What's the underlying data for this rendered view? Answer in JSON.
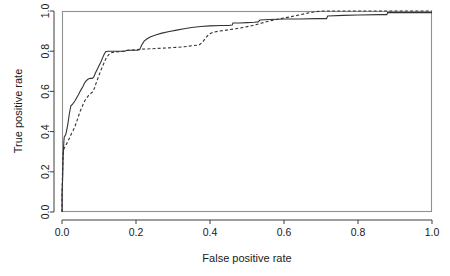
{
  "chart_data": {
    "type": "line",
    "title": "",
    "xlabel": "False positive rate",
    "ylabel": "True positive rate",
    "xlim": [
      0.0,
      1.0
    ],
    "ylim": [
      0.0,
      1.0
    ],
    "grid": false,
    "legend": "none",
    "xticks": [
      "0.0",
      "0.2",
      "0.4",
      "0.6",
      "0.8",
      "1.0"
    ],
    "xtick_values": [
      0.0,
      0.2,
      0.4,
      0.6,
      0.8,
      1.0
    ],
    "yticks": [
      "0.0",
      "0.2",
      "0.4",
      "0.6",
      "0.8",
      "1.0"
    ],
    "ytick_values": [
      0.0,
      0.2,
      0.4,
      0.6,
      0.8,
      1.0
    ],
    "series": [
      {
        "name": "solid-roc-curve",
        "style": "solid",
        "color": "#333333",
        "points": [
          [
            0.0,
            0.0
          ],
          [
            0.0,
            0.09
          ],
          [
            0.002,
            0.18
          ],
          [
            0.003,
            0.265
          ],
          [
            0.004,
            0.31
          ],
          [
            0.005,
            0.35
          ],
          [
            0.006,
            0.372
          ],
          [
            0.01,
            0.385
          ],
          [
            0.012,
            0.4
          ],
          [
            0.014,
            0.42
          ],
          [
            0.016,
            0.44
          ],
          [
            0.018,
            0.465
          ],
          [
            0.02,
            0.49
          ],
          [
            0.022,
            0.51
          ],
          [
            0.024,
            0.528
          ],
          [
            0.028,
            0.535
          ],
          [
            0.032,
            0.545
          ],
          [
            0.036,
            0.556
          ],
          [
            0.04,
            0.57
          ],
          [
            0.044,
            0.582
          ],
          [
            0.048,
            0.597
          ],
          [
            0.052,
            0.61
          ],
          [
            0.056,
            0.622
          ],
          [
            0.06,
            0.638
          ],
          [
            0.064,
            0.65
          ],
          [
            0.07,
            0.66
          ],
          [
            0.076,
            0.665
          ],
          [
            0.082,
            0.665
          ],
          [
            0.086,
            0.672
          ],
          [
            0.09,
            0.69
          ],
          [
            0.094,
            0.705
          ],
          [
            0.098,
            0.72
          ],
          [
            0.102,
            0.735
          ],
          [
            0.106,
            0.75
          ],
          [
            0.11,
            0.768
          ],
          [
            0.114,
            0.785
          ],
          [
            0.118,
            0.797
          ],
          [
            0.124,
            0.8
          ],
          [
            0.15,
            0.8
          ],
          [
            0.17,
            0.8
          ],
          [
            0.175,
            0.805
          ],
          [
            0.195,
            0.805
          ],
          [
            0.205,
            0.805
          ],
          [
            0.21,
            0.808
          ],
          [
            0.215,
            0.83
          ],
          [
            0.222,
            0.85
          ],
          [
            0.23,
            0.862
          ],
          [
            0.24,
            0.872
          ],
          [
            0.255,
            0.882
          ],
          [
            0.27,
            0.89
          ],
          [
            0.29,
            0.898
          ],
          [
            0.31,
            0.905
          ],
          [
            0.33,
            0.912
          ],
          [
            0.35,
            0.918
          ],
          [
            0.375,
            0.923
          ],
          [
            0.4,
            0.926
          ],
          [
            0.43,
            0.928
          ],
          [
            0.45,
            0.928
          ],
          [
            0.46,
            0.93
          ],
          [
            0.462,
            0.94
          ],
          [
            0.48,
            0.94
          ],
          [
            0.5,
            0.942
          ],
          [
            0.52,
            0.944
          ],
          [
            0.53,
            0.946
          ],
          [
            0.535,
            0.955
          ],
          [
            0.56,
            0.958
          ],
          [
            0.6,
            0.96
          ],
          [
            0.64,
            0.96
          ],
          [
            0.69,
            0.962
          ],
          [
            0.715,
            0.962
          ],
          [
            0.718,
            0.975
          ],
          [
            0.76,
            0.978
          ],
          [
            0.8,
            0.98
          ],
          [
            0.86,
            0.982
          ],
          [
            0.878,
            0.982
          ],
          [
            0.88,
            0.992
          ],
          [
            0.94,
            0.992
          ],
          [
            1.0,
            0.992
          ]
        ]
      },
      {
        "name": "dashed-roc-curve",
        "style": "dashed",
        "color": "#333333",
        "points": [
          [
            0.0,
            0.0
          ],
          [
            0.0,
            0.08
          ],
          [
            0.001,
            0.16
          ],
          [
            0.002,
            0.24
          ],
          [
            0.003,
            0.29
          ],
          [
            0.004,
            0.305
          ],
          [
            0.006,
            0.318
          ],
          [
            0.01,
            0.33
          ],
          [
            0.014,
            0.345
          ],
          [
            0.018,
            0.36
          ],
          [
            0.022,
            0.375
          ],
          [
            0.026,
            0.392
          ],
          [
            0.03,
            0.405
          ],
          [
            0.034,
            0.42
          ],
          [
            0.038,
            0.44
          ],
          [
            0.042,
            0.462
          ],
          [
            0.046,
            0.485
          ],
          [
            0.05,
            0.505
          ],
          [
            0.054,
            0.522
          ],
          [
            0.058,
            0.54
          ],
          [
            0.062,
            0.555
          ],
          [
            0.068,
            0.57
          ],
          [
            0.072,
            0.58
          ],
          [
            0.078,
            0.59
          ],
          [
            0.084,
            0.6
          ],
          [
            0.088,
            0.618
          ],
          [
            0.092,
            0.64
          ],
          [
            0.096,
            0.66
          ],
          [
            0.1,
            0.68
          ],
          [
            0.104,
            0.7
          ],
          [
            0.108,
            0.718
          ],
          [
            0.112,
            0.735
          ],
          [
            0.116,
            0.752
          ],
          [
            0.12,
            0.768
          ],
          [
            0.126,
            0.782
          ],
          [
            0.132,
            0.792
          ],
          [
            0.14,
            0.795
          ],
          [
            0.16,
            0.798
          ],
          [
            0.18,
            0.805
          ],
          [
            0.2,
            0.808
          ],
          [
            0.215,
            0.81
          ],
          [
            0.24,
            0.812
          ],
          [
            0.27,
            0.815
          ],
          [
            0.3,
            0.818
          ],
          [
            0.33,
            0.822
          ],
          [
            0.355,
            0.828
          ],
          [
            0.37,
            0.83
          ],
          [
            0.38,
            0.845
          ],
          [
            0.39,
            0.87
          ],
          [
            0.398,
            0.885
          ],
          [
            0.41,
            0.895
          ],
          [
            0.425,
            0.9
          ],
          [
            0.445,
            0.905
          ],
          [
            0.47,
            0.912
          ],
          [
            0.495,
            0.92
          ],
          [
            0.52,
            0.93
          ],
          [
            0.54,
            0.94
          ],
          [
            0.56,
            0.95
          ],
          [
            0.58,
            0.958
          ],
          [
            0.6,
            0.965
          ],
          [
            0.62,
            0.972
          ],
          [
            0.64,
            0.98
          ],
          [
            0.66,
            0.988
          ],
          [
            0.68,
            0.995
          ],
          [
            0.7,
            1.0
          ],
          [
            0.8,
            1.0
          ],
          [
            0.9,
            1.0
          ],
          [
            1.0,
            1.0
          ]
        ]
      }
    ]
  },
  "plot": {
    "x_left": 62,
    "x_right": 432,
    "y_top": 11,
    "y_bottom": 212
  }
}
